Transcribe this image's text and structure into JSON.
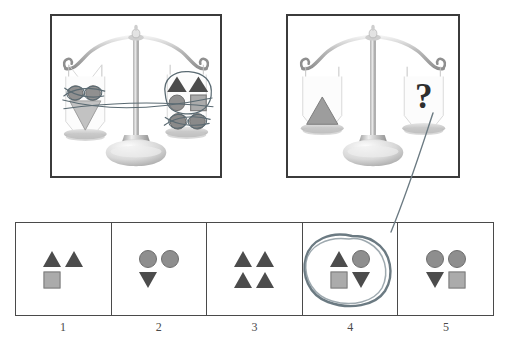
{
  "puzzle": {
    "type": "balance-scale-reasoning",
    "title_text": "",
    "unknown_symbol": "?"
  },
  "balances": [
    {
      "id": "balance-given",
      "state": "level",
      "left_pan": {
        "label": "left-pan-contents",
        "shapes": [
          "triangle-down",
          "circle",
          "circle"
        ],
        "annotation": "circles-crossed-out"
      },
      "right_pan": {
        "label": "right-pan-contents",
        "shapes": [
          "triangle-up",
          "triangle-up",
          "circle",
          "square",
          "circle",
          "circle"
        ],
        "annotation": "circled-group-and-crossed-out-circles"
      }
    },
    {
      "id": "balance-question",
      "state": "level",
      "left_pan": {
        "label": "left-pan-contents",
        "shapes": [
          "triangle-up"
        ],
        "annotation": ""
      },
      "right_pan": {
        "label": "right-pan-contents",
        "shapes": [],
        "annotation": "question-mark"
      }
    }
  ],
  "options": {
    "selected_index": 4,
    "items": [
      {
        "number": "1",
        "shapes": [
          "triangle-up",
          "triangle-up",
          "square",
          "empty"
        ],
        "selected": false
      },
      {
        "number": "2",
        "shapes": [
          "circle",
          "circle",
          "triangle-down",
          "empty"
        ],
        "selected": false
      },
      {
        "number": "3",
        "shapes": [
          "triangle-up",
          "triangle-up",
          "triangle-up",
          "triangle-up"
        ],
        "selected": false
      },
      {
        "number": "4",
        "shapes": [
          "triangle-up",
          "circle",
          "square",
          "triangle-down"
        ],
        "selected": true
      },
      {
        "number": "5",
        "shapes": [
          "circle",
          "circle",
          "triangle-down",
          "square"
        ],
        "selected": false
      }
    ]
  },
  "annotations": {
    "pen_color": "#5a6a72",
    "pen_ink_label": "hand-drawn-pen-marks",
    "leader_line": "from-question-pan-to-option-4",
    "circle_marker": "circle-around-option-4"
  },
  "colors": {
    "triangle": "#4c4c4c",
    "circle": "#8e8e8e",
    "square": "#ababab",
    "frame": "#3b3b3b",
    "option_border": "#4a4a4a",
    "number_text": "#4a4a4a",
    "background": "#ffffff"
  }
}
